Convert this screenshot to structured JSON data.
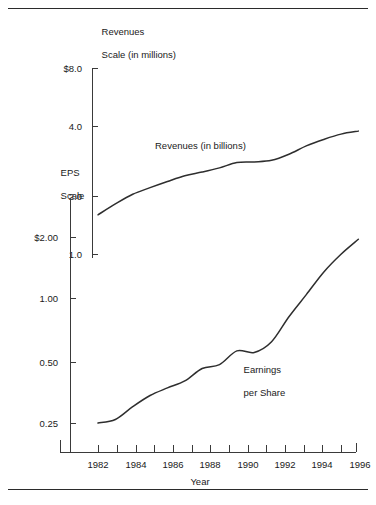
{
  "figure": {
    "top_rule": true,
    "bottom_rule": true
  },
  "revenue_axis": {
    "header_line1": "Revenues",
    "header_line2": "Scale (in millions)",
    "ticks": [
      "$8.0",
      "4.0",
      "2.0",
      "1.0"
    ]
  },
  "eps_axis": {
    "header_line1": "EPS",
    "header_line2": "Scale",
    "ticks": [
      "$2.00",
      "1.00",
      "0.50",
      "0.25"
    ]
  },
  "x_axis": {
    "title": "Year",
    "labels": [
      "1982",
      "1984",
      "1986",
      "1988",
      "1990",
      "1992",
      "1994",
      "1996"
    ]
  },
  "annotations": {
    "revenues": "Revenues (in billions)",
    "eps_line1": "Earnings",
    "eps_line2": "per Share"
  },
  "chart_data": {
    "type": "line",
    "title": "",
    "subtitle": "",
    "xlabel": "Year",
    "ylabel": "Revenues Scale (in millions)",
    "y2label": "EPS Scale",
    "grid": false,
    "legend": "inline-annotations",
    "x": [
      1982,
      1983,
      1984,
      1985,
      1986,
      1987,
      1988,
      1989,
      1990,
      1991,
      1992,
      1993,
      1994,
      1995,
      1996,
      1997
    ],
    "xlim": [
      1981.5,
      1997.5
    ],
    "xticks_every": 1,
    "xticklabels_every": 2,
    "yscale": "log",
    "ylim": [
      1.0,
      8.0
    ],
    "yticks": [
      1.0,
      2.0,
      4.0,
      8.0
    ],
    "yticklabels": [
      "1.0",
      "2.0",
      "4.0",
      "$8.0"
    ],
    "y2scale": "log",
    "y2lim": [
      0.25,
      2.0
    ],
    "y2ticks": [
      0.25,
      0.5,
      1.0,
      2.0
    ],
    "y2ticklabels": [
      "0.25",
      "0.50",
      "1.00",
      "$2.00"
    ],
    "series": [
      {
        "name": "Revenues (in billions)",
        "axis": "left",
        "units": "billions",
        "values": [
          1.55,
          1.75,
          1.95,
          2.1,
          2.25,
          2.4,
          2.5,
          2.62,
          2.78,
          2.8,
          2.85,
          3.05,
          3.35,
          3.6,
          3.82,
          3.95
        ]
      },
      {
        "name": "Earnings per Share",
        "axis": "right",
        "units": "dollars",
        "values": [
          0.25,
          0.26,
          0.3,
          0.34,
          0.37,
          0.4,
          0.46,
          0.48,
          0.56,
          0.55,
          0.62,
          0.82,
          1.05,
          1.35,
          1.65,
          1.95
        ]
      }
    ]
  }
}
